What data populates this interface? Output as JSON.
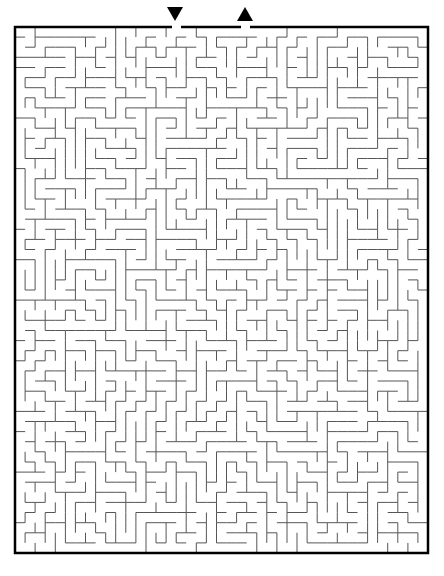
{
  "puzzle": {
    "type": "maze",
    "cols": 41,
    "rows": 52,
    "entry_marker": "down-arrow",
    "exit_marker": "up-arrow",
    "colors": {
      "wall": "#555555",
      "border": "#000000",
      "background": "#ffffff",
      "marker": "#000000"
    }
  }
}
